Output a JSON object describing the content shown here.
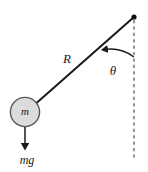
{
  "figure": {
    "kind": "physics-free-body-diagram",
    "width": 148,
    "height": 172,
    "background_color": "#ffffff"
  },
  "colors": {
    "stroke": "#1a1a1a",
    "bob_fill": "#dcdcdc",
    "bob_stroke": "#55595c",
    "dashed_line": "#4a4e52",
    "label": "#1a1a1a"
  },
  "labels": {
    "rod_length": "R",
    "mass": "m",
    "weight_force": "mg",
    "angle": "θ"
  },
  "geometry": {
    "pivot": {
      "x": 134,
      "y": 17
    },
    "bob_center": {
      "x": 25,
      "y": 112
    },
    "bob_radius": 15,
    "rod_start": {
      "x": 134,
      "y": 17
    },
    "rod_end": {
      "x": 36,
      "y": 103
    },
    "vertical_dashed": {
      "x": 134,
      "y_start": 20,
      "y_end": 160
    },
    "weight_arrow": {
      "x": 25,
      "y_start": 127,
      "y_end": 149
    },
    "arc_radius": 40,
    "arc_from_vertical_deg": 0,
    "arc_to_rod_deg": 48
  },
  "label_positions": {
    "rod_length": {
      "x": 67,
      "y": 60
    },
    "mass": {
      "x": 25,
      "y": 112
    },
    "weight_force": {
      "x": 27,
      "y": 161
    },
    "angle": {
      "x": 113,
      "y": 72
    }
  }
}
